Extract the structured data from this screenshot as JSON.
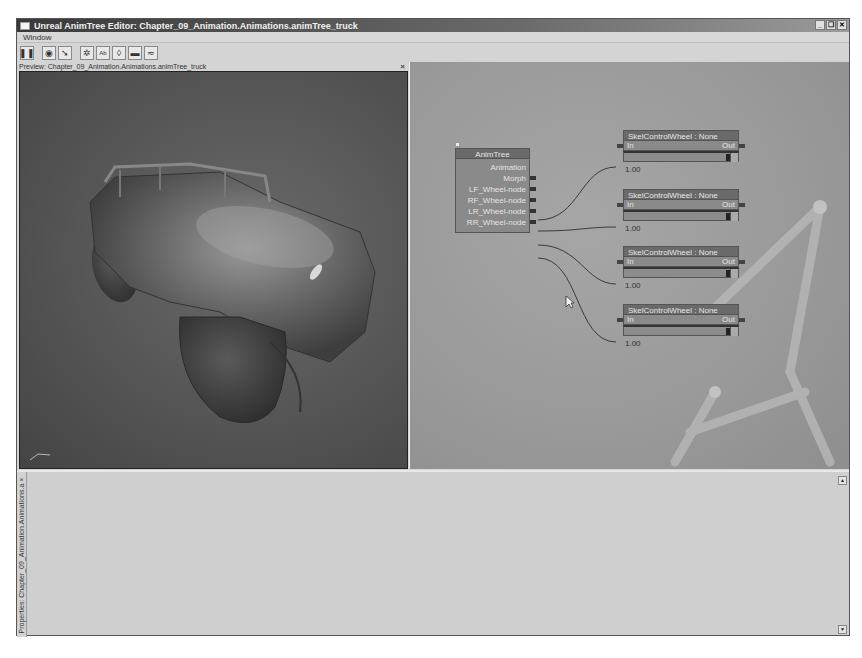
{
  "window": {
    "title": "Unreal AnimTree Editor: Chapter_09_Animation.Animations.animTree_truck",
    "controls": [
      "minimize",
      "restore",
      "close"
    ]
  },
  "menubar": {
    "items": [
      {
        "label": "Window"
      }
    ]
  },
  "toolbar": {
    "buttons": [
      {
        "name": "pause-button",
        "icon": "pause-icon",
        "glyph": "❚❚"
      },
      {
        "name": "show-mesh-button",
        "icon": "eye-icon",
        "glyph": "◉"
      },
      {
        "name": "show-normals-button",
        "icon": "arrow-icon",
        "glyph": "➘"
      },
      {
        "name": "show-skeleton-button",
        "icon": "figure-icon",
        "glyph": "✲"
      },
      {
        "name": "show-bone-names-button",
        "icon": "text-ab-icon",
        "glyph": "Ab"
      },
      {
        "name": "show-bounds-button",
        "icon": "capsule-icon",
        "glyph": "◊"
      },
      {
        "name": "show-floor-button",
        "icon": "floor-bar-icon",
        "glyph": "▬"
      },
      {
        "name": "curve-options-button",
        "icon": "curve-icon",
        "glyph": "≂"
      }
    ]
  },
  "preview": {
    "header": "Preview: Chapter_09_Animation.Animations.animTree_truck",
    "close_glyph": "×"
  },
  "graph": {
    "animtree_node": {
      "title": "AnimTree",
      "outputs": [
        {
          "label": "Animation"
        },
        {
          "label": "Morph"
        },
        {
          "label": "LF_Wheel-node"
        },
        {
          "label": "RF_Wheel-node"
        },
        {
          "label": "LR_Wheel-node"
        },
        {
          "label": "RR_Wheel-node"
        }
      ]
    },
    "skel_nodes": [
      {
        "title": "SkelControlWheel : None",
        "in_label": "In",
        "out_label": "Out",
        "value": "1.00"
      },
      {
        "title": "SkelControlWheel : None",
        "in_label": "In",
        "out_label": "Out",
        "value": "1.00"
      },
      {
        "title": "SkelControlWheel : None",
        "in_label": "In",
        "out_label": "Out",
        "value": "1.00"
      },
      {
        "title": "SkelControlWheel : None",
        "in_label": "In",
        "out_label": "Out",
        "value": "1.00"
      }
    ]
  },
  "properties": {
    "tab_label": "Properties: Chapter_09_Animation.Animations.a ×"
  },
  "colors": {
    "titlebar": "#3a3a3a",
    "viewport_bg": "#555555",
    "graph_bg": "#9a9a9a",
    "node_title": "#6a6a6a",
    "node_body": "#8a8a8a",
    "panel_bg": "#d4d4d4"
  }
}
